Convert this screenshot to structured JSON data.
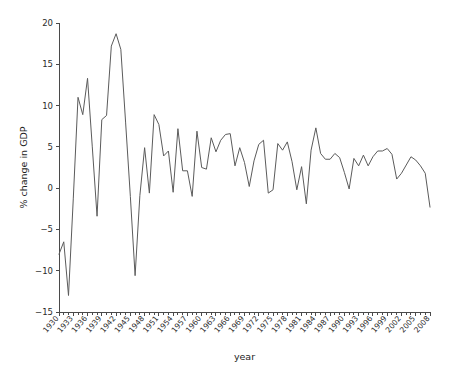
{
  "chart_data": {
    "type": "line",
    "title": "",
    "xlabel": "year",
    "ylabel": "% change in GDP",
    "xlim": [
      1930,
      2008
    ],
    "ylim": [
      -15,
      20
    ],
    "ytick_values": [
      -15,
      -10,
      -5,
      0,
      5,
      10,
      15,
      20
    ],
    "ytick_labels": [
      "-15",
      "-10",
      "-5",
      "0",
      "5",
      "10",
      "15",
      "20"
    ],
    "xtick_values": [
      1930,
      1933,
      1936,
      1939,
      1942,
      1945,
      1948,
      1951,
      1954,
      1957,
      1960,
      1963,
      1966,
      1969,
      1972,
      1975,
      1978,
      1981,
      1984,
      1987,
      1990,
      1993,
      1996,
      1999,
      2002,
      2005,
      2008
    ],
    "xtick_labels": [
      "1930",
      "1933",
      "1936",
      "1939",
      "1942",
      "1945",
      "1948",
      "1951",
      "1954",
      "1957",
      "1960",
      "1963",
      "1966",
      "1969",
      "1972",
      "1975",
      "1978",
      "1981",
      "1984",
      "1987",
      "1990",
      "1993",
      "1996",
      "1999",
      "2002",
      "2005",
      "2008"
    ],
    "xtick_minor_interval": 1,
    "grid": false,
    "legend": null,
    "line_color": "#5b5b5b",
    "axis_color": "#4a4a4a",
    "background_color": "#ffffff",
    "x": [
      1930,
      1931,
      1932,
      1933,
      1934,
      1935,
      1936,
      1937,
      1938,
      1939,
      1940,
      1941,
      1942,
      1943,
      1944,
      1945,
      1946,
      1947,
      1948,
      1949,
      1950,
      1951,
      1952,
      1953,
      1954,
      1955,
      1956,
      1957,
      1958,
      1959,
      1960,
      1961,
      1962,
      1963,
      1964,
      1965,
      1966,
      1967,
      1968,
      1969,
      1970,
      1971,
      1972,
      1973,
      1974,
      1975,
      1976,
      1977,
      1978,
      1979,
      1980,
      1981,
      1982,
      1983,
      1984,
      1985,
      1986,
      1987,
      1988,
      1989,
      1990,
      1991,
      1992,
      1993,
      1994,
      1995,
      1996,
      1997,
      1998,
      1999,
      2000,
      2001,
      2002,
      2003,
      2004,
      2005,
      2006,
      2007,
      2008
    ],
    "y": [
      -8.0,
      -6.5,
      -13.0,
      -1.3,
      11.0,
      8.9,
      13.3,
      5.0,
      -3.4,
      8.3,
      8.8,
      17.2,
      18.7,
      16.8,
      8.0,
      -1.0,
      -10.6,
      -0.9,
      4.9,
      -0.6,
      8.9,
      7.7,
      3.9,
      4.5,
      -0.5,
      7.2,
      2.1,
      2.1,
      -1.0,
      6.9,
      2.5,
      2.3,
      6.1,
      4.4,
      5.8,
      6.5,
      6.6,
      2.7,
      4.9,
      3.1,
      0.2,
      3.3,
      5.3,
      5.8,
      -0.6,
      -0.2,
      5.4,
      4.6,
      5.6,
      3.2,
      -0.2,
      2.6,
      -1.9,
      4.6,
      7.3,
      4.2,
      3.5,
      3.5,
      4.2,
      3.7,
      1.9,
      -0.1,
      3.6,
      2.7,
      4.0,
      2.7,
      3.8,
      4.5,
      4.5,
      4.8,
      4.1,
      1.1,
      1.8,
      2.8,
      3.8,
      3.4,
      2.7,
      1.8,
      -2.3
    ]
  },
  "figure": {
    "width": 456,
    "height": 365
  }
}
